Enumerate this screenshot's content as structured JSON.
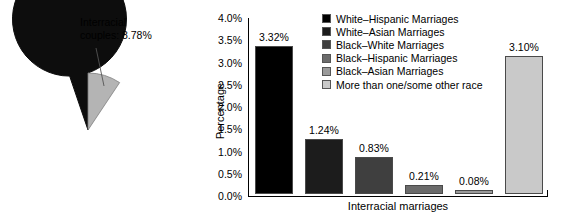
{
  "figure": {
    "title": "",
    "panels": [
      "pie-chart-interracial-couples",
      "bar-chart-interracial-marriages"
    ]
  },
  "pie": {
    "callouts": {
      "interracial_line1": "Interracial",
      "interracial_line2": "couples: 8.78%",
      "samerace_line1": "Same-race",
      "samerace_line2": "couples: 91.22%"
    }
  },
  "bar": {
    "xlabel": "Interracial marriages",
    "ylabel": "Percentage"
  },
  "legend": {
    "items": [
      {
        "label": "White–Hispanic Marriages",
        "color": "#000000"
      },
      {
        "label": "White–Asian Marriages",
        "color": "#1c1c1c"
      },
      {
        "label": "Black–White Marriages",
        "color": "#3f3f3f"
      },
      {
        "label": "Black–Hispanic Marriages",
        "color": "#6b6b6b"
      },
      {
        "label": "Black–Asian Marriages",
        "color": "#9a9a9a"
      },
      {
        "label": "More than one/some other race",
        "color": "#c9c9c9"
      }
    ]
  },
  "chart_data": [
    {
      "type": "pie",
      "title": "",
      "labels": [
        "Interracial couples",
        "Same-race couples"
      ],
      "values": [
        8.78,
        91.22
      ],
      "value_labels": [
        "8.78%",
        "91.22%"
      ],
      "colors": [
        "#b4b4b4",
        "#0d0d0d"
      ],
      "start_angle_deg": 90,
      "direction": "clockwise",
      "legend": "none",
      "annotations": [
        "Interracial couples: 8.78%",
        "Same-race couples: 91.22%"
      ]
    },
    {
      "type": "bar",
      "title": "",
      "xlabel": "Interracial marriages",
      "ylabel": "Percentage",
      "categories": [
        "White–Hispanic Marriages",
        "White–Asian Marriages",
        "Black–White Marriages",
        "Black–Hispanic Marriages",
        "Black–Asian Marriages",
        "More than one/some other race"
      ],
      "values": [
        3.32,
        1.24,
        0.83,
        0.21,
        0.08,
        3.1
      ],
      "data_labels": [
        "3.32%",
        "1.24%",
        "0.83%",
        "0.21%",
        "0.08%",
        "3.10%"
      ],
      "colors": [
        "#000000",
        "#1c1c1c",
        "#3f3f3f",
        "#6b6b6b",
        "#9a9a9a",
        "#c9c9c9"
      ],
      "ylim": [
        0,
        4.0
      ],
      "ytick_values": [
        0.0,
        0.5,
        1.0,
        1.5,
        2.0,
        2.5,
        3.0,
        3.5,
        4.0
      ],
      "ytick_labels": [
        "0.0%",
        "0.5%",
        "1.0%",
        "1.5%",
        "2.0%",
        "2.5%",
        "3.0%",
        "3.5%",
        "4.0%"
      ],
      "xtick_labels": [],
      "grid": false,
      "legend_position": "upper-center-inside"
    }
  ]
}
